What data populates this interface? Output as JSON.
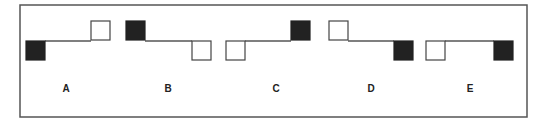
{
  "diagram": {
    "colors": {
      "filled": "#222222",
      "empty": "#ffffff",
      "stroke": "#444444",
      "frame": "#555555"
    },
    "options": [
      {
        "label": "A",
        "left": {
          "fill": "black",
          "level": "lower"
        },
        "right": {
          "fill": "white",
          "level": "upper"
        }
      },
      {
        "label": "B",
        "left": {
          "fill": "black",
          "level": "upper"
        },
        "right": {
          "fill": "white",
          "level": "lower"
        }
      },
      {
        "label": "C",
        "left": {
          "fill": "white",
          "level": "lower"
        },
        "right": {
          "fill": "black",
          "level": "upper"
        }
      },
      {
        "label": "D",
        "left": {
          "fill": "white",
          "level": "upper"
        },
        "right": {
          "fill": "black",
          "level": "lower"
        }
      },
      {
        "label": "E",
        "left": {
          "fill": "white",
          "level": "lower"
        },
        "right": {
          "fill": "black",
          "level": "lower"
        }
      }
    ]
  }
}
